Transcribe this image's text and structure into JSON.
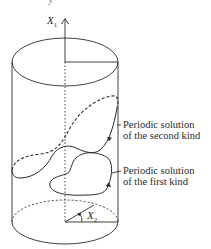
{
  "diagram": {
    "type": "cylinder-phase-space",
    "axes": {
      "x1": {
        "name": "X",
        "sub": "1"
      },
      "x2": {
        "name": "X",
        "sub": "2"
      }
    },
    "labels": {
      "second_kind": {
        "line1": "Periodic solution",
        "line2": "of the second kind"
      },
      "first_kind": {
        "line1": "Periodic solution",
        "line2": "of the first kind"
      }
    },
    "top_cut_text": "y",
    "colors": {
      "stroke": "#2a2a2a",
      "background": "#ffffff"
    }
  }
}
